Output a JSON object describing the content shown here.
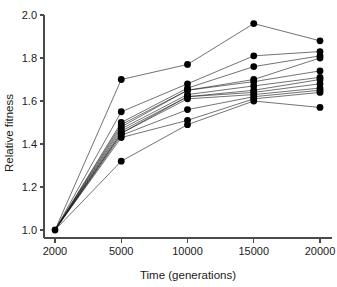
{
  "chart_data": {
    "type": "line",
    "title": "",
    "subtitle": "",
    "xlabel": "Time (generations)",
    "ylabel": "Relative fitness",
    "x": [
      2000,
      5000,
      10000,
      15000,
      20000
    ],
    "xticklabels": [
      "2000",
      "5000",
      "10000",
      "15000",
      "20000"
    ],
    "yticks": [
      1.0,
      1.2,
      1.4,
      1.6,
      1.8,
      2.0
    ],
    "yticklabels": [
      "1.0",
      "1.2",
      "1.4",
      "1.6",
      "1.8",
      "2.0"
    ],
    "xlim": [
      2000,
      20000
    ],
    "ylim": [
      1.0,
      2.0
    ],
    "grid": false,
    "legend": null,
    "legend_position": "none",
    "marker": "filled-circle",
    "marker_size": 5,
    "annotations": [],
    "series": [
      {
        "name": "Population 1",
        "values": [
          1.0,
          1.7,
          1.77,
          1.96,
          1.88
        ]
      },
      {
        "name": "Population 2",
        "values": [
          1.0,
          1.55,
          1.68,
          1.81,
          1.83
        ]
      },
      {
        "name": "Population 3",
        "values": [
          1.0,
          1.5,
          1.66,
          1.76,
          1.81
        ]
      },
      {
        "name": "Population 4",
        "values": [
          1.0,
          1.49,
          1.65,
          1.7,
          1.8
        ]
      },
      {
        "name": "Population 5",
        "values": [
          1.0,
          1.48,
          1.65,
          1.69,
          1.74
        ]
      },
      {
        "name": "Population 6",
        "values": [
          1.0,
          1.47,
          1.63,
          1.67,
          1.71
        ]
      },
      {
        "name": "Population 7",
        "values": [
          1.0,
          1.46,
          1.62,
          1.65,
          1.7
        ]
      },
      {
        "name": "Population 8",
        "values": [
          1.0,
          1.45,
          1.62,
          1.64,
          1.68
        ]
      },
      {
        "name": "Population 9",
        "values": [
          1.0,
          1.45,
          1.61,
          1.63,
          1.66
        ]
      },
      {
        "name": "Population 10",
        "values": [
          1.0,
          1.44,
          1.56,
          1.62,
          1.65
        ]
      },
      {
        "name": "Population 11",
        "values": [
          1.0,
          1.43,
          1.51,
          1.61,
          1.64
        ]
      },
      {
        "name": "Population 12",
        "values": [
          1.0,
          1.32,
          1.49,
          1.6,
          1.57
        ]
      }
    ]
  }
}
